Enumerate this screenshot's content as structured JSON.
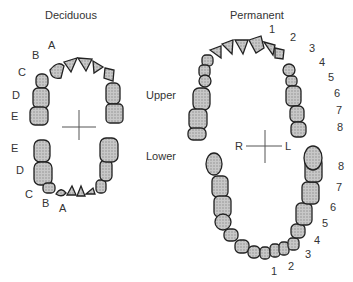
{
  "titles": {
    "deciduous": "Deciduous",
    "permanent": "Permanent"
  },
  "arches": {
    "upper": "Upper",
    "lower": "Lower"
  },
  "orientation": {
    "right": "R",
    "left": "L"
  },
  "deciduous_upper_labels": [
    "A",
    "B",
    "C",
    "D",
    "E"
  ],
  "deciduous_lower_labels": [
    "E",
    "D",
    "C",
    "B",
    "A"
  ],
  "permanent_upper_labels": [
    "1",
    "2",
    "3",
    "4",
    "5",
    "6",
    "7",
    "8"
  ],
  "permanent_lower_labels": [
    "8",
    "7",
    "6",
    "5",
    "4",
    "3",
    "2",
    "1"
  ]
}
